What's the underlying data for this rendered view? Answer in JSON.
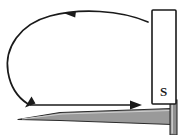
{
  "figure": {
    "name": "magnet-and-nail-attraction-diagram",
    "background_color": "#ffffff"
  },
  "magnet": {
    "name": "bar-magnet",
    "pole_label": "S",
    "orientation": "vertical",
    "fill_color": "#ffffff",
    "stroke_color": "#1a1a1a",
    "x": 152,
    "y": 10,
    "width": 24,
    "height": 94
  },
  "nail": {
    "name": "iron-nail",
    "body_fill": "#9a9a9a",
    "body_stroke": "#2b2b2b",
    "head_fill": "#8e8e8e",
    "tip_x": 18,
    "head_x": 176
  },
  "arrows": {
    "curved": {
      "name": "curved-field-arrow",
      "color": "#1a1a1a",
      "direction": "counterclockwise",
      "head_top_label": "",
      "head_bottom_label": ""
    },
    "straight": {
      "name": "straight-force-arrow",
      "color": "#1a1a1a",
      "direction": "right",
      "label": ""
    }
  },
  "icons": {
    "arrowhead": "arrowhead-icon",
    "magnet": "bar-magnet-icon",
    "nail": "nail-icon"
  }
}
